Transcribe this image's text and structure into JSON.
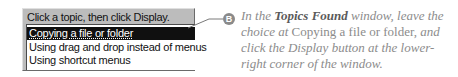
{
  "dialog": {
    "prompt": "Click a topic, then click Display.",
    "items": [
      {
        "label": "Copying a file or folder",
        "selected": true
      },
      {
        "label": "Using drag and drop instead of menus",
        "selected": false
      },
      {
        "label": "Using shortcut menus",
        "selected": false
      }
    ]
  },
  "callout": {
    "badge": "B",
    "parts": {
      "p1": "In the ",
      "p2": "Topics Found",
      "p3": " window, leave the choice at ",
      "p4": "Copying a file or folder,",
      "p5": " and click the ",
      "p6": "Display",
      "p7": " button at the lower-right corner of the window."
    }
  },
  "colors": {
    "dialog_bg": "#bcbcbc",
    "selection_bg": "#101010",
    "caption_text": "#8c8c8c",
    "badge": "#8a8a8a"
  }
}
